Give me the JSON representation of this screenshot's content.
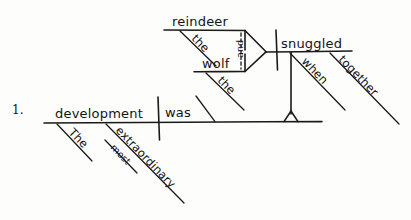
{
  "page": {
    "item_number": "1.",
    "background_color": "#fdfdfc",
    "ink_color": "#1a1a1a"
  },
  "diagram": {
    "type": "reed-kellogg-sentence-diagram",
    "sentence": "The most extraordinary development was when the reindeer and the wolf snuggled together",
    "main_clause": {
      "subject": "development",
      "verb": "was",
      "subject_modifiers": [
        {
          "word": "The",
          "part_of_speech": "article"
        },
        {
          "word": "extraordinary",
          "part_of_speech": "adjective"
        }
      ],
      "adjective_modifiers": [
        {
          "word": "most",
          "modifies": "extraordinary",
          "part_of_speech": "adverb"
        }
      ],
      "predicate_slant_label": ""
    },
    "subordinate_clause": {
      "conjunction": "when",
      "verb": "snuggled",
      "verb_modifiers": [
        {
          "word": "together",
          "part_of_speech": "adverb"
        }
      ],
      "compound_subject": {
        "conjunction": "and",
        "items": [
          {
            "word": "reindeer",
            "modifiers": [
              {
                "word": "the",
                "part_of_speech": "article"
              }
            ]
          },
          {
            "word": "wolf",
            "modifiers": [
              {
                "word": "the",
                "part_of_speech": "article"
              }
            ]
          }
        ]
      }
    },
    "labels": {
      "reindeer": "reindeer",
      "reindeer_the": "the",
      "wolf": "wolf",
      "wolf_the": "the",
      "and": "and",
      "snuggled": "snuggled",
      "when": "when",
      "together": "together",
      "development": "development",
      "was": "was",
      "the": "The",
      "extraordinary": "extraordinary",
      "most": "most"
    }
  }
}
